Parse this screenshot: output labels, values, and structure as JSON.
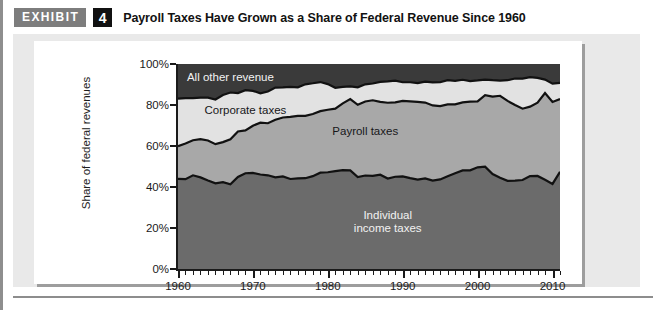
{
  "header": {
    "badge_label": "EXHIBIT",
    "exhibit_number": "4",
    "title": "Payroll Taxes Have Grown as a Share of Federal Revenue Since 1960"
  },
  "colors": {
    "individual_income_taxes": "#6b6b6b",
    "payroll_taxes": "#a8a8a8",
    "corporate_taxes": "#e2e2e2",
    "all_other_revenue": "#3a3a3a",
    "outline": "#111111",
    "panel_background": "#e9e9e9",
    "card_background": "#ffffff",
    "badge_background": "#7d7d7d",
    "number_background": "#111111"
  },
  "chart_data": {
    "type": "area",
    "stacked": true,
    "title": "Payroll Taxes Have Grown as a Share of Federal Revenue Since 1960",
    "xlabel": "",
    "ylabel": "Share of federal revenues",
    "xlim": [
      1960,
      2011
    ],
    "ylim": [
      0,
      100
    ],
    "grid": false,
    "legend_position": "inline-labels",
    "y_ticks": [
      "0%",
      "20%",
      "40%",
      "60%",
      "80%",
      "100%"
    ],
    "y_tick_values": [
      0,
      20,
      40,
      60,
      80,
      100
    ],
    "x_ticks": [
      "1960",
      "1970",
      "1980",
      "1990",
      "2000",
      "2010"
    ],
    "x_tick_values": [
      1960,
      1970,
      1980,
      1990,
      2000,
      2010
    ],
    "x_minor_tick_interval": 1,
    "x": [
      1960,
      1961,
      1962,
      1963,
      1964,
      1965,
      1966,
      1967,
      1968,
      1969,
      1970,
      1971,
      1972,
      1973,
      1974,
      1975,
      1976,
      1977,
      1978,
      1979,
      1980,
      1981,
      1982,
      1983,
      1984,
      1985,
      1986,
      1987,
      1988,
      1989,
      1990,
      1991,
      1992,
      1993,
      1994,
      1995,
      1996,
      1997,
      1998,
      1999,
      2000,
      2001,
      2002,
      2003,
      2004,
      2005,
      2006,
      2007,
      2008,
      2009,
      2010,
      2011
    ],
    "series": [
      {
        "name": "Individual income taxes",
        "label": "Individual income taxes",
        "label_color": "#f2f2f2",
        "color": "#6b6b6b",
        "values": [
          44.0,
          43.8,
          45.7,
          44.7,
          43.2,
          41.8,
          42.4,
          41.3,
          44.9,
          46.7,
          46.9,
          46.1,
          45.7,
          44.7,
          45.2,
          43.9,
          44.2,
          44.3,
          45.3,
          47.0,
          47.2,
          47.7,
          48.2,
          48.1,
          44.8,
          45.6,
          45.4,
          46.0,
          44.1,
          45.0,
          45.2,
          44.3,
          43.6,
          44.2,
          43.1,
          43.7,
          45.2,
          46.7,
          48.1,
          48.1,
          49.6,
          49.9,
          46.3,
          44.5,
          43.0,
          43.1,
          43.4,
          45.3,
          45.4,
          43.5,
          41.5,
          47.4
        ]
      },
      {
        "name": "Payroll taxes",
        "label": "Payroll taxes",
        "label_color": "#17171a",
        "color": "#a8a8a8",
        "values": [
          15.9,
          17.4,
          17.1,
          18.6,
          19.5,
          19.1,
          19.5,
          22.0,
          22.2,
          20.9,
          23.0,
          25.3,
          25.4,
          28.1,
          28.7,
          30.3,
          30.5,
          30.4,
          30.3,
          30.0,
          30.5,
          30.5,
          32.6,
          34.8,
          35.3,
          36.1,
          36.9,
          35.5,
          37.0,
          36.3,
          36.8,
          37.5,
          37.9,
          37.0,
          36.7,
          35.8,
          35.1,
          33.6,
          33.2,
          33.5,
          32.2,
          34.9,
          37.8,
          40.0,
          39.0,
          36.9,
          34.8,
          33.9,
          35.7,
          42.3,
          40.0,
          35.5
        ]
      },
      {
        "name": "Corporate taxes",
        "label": "Corporate taxes",
        "label_color": "#17171a",
        "color": "#e2e2e2",
        "values": [
          23.2,
          22.2,
          20.6,
          20.3,
          20.9,
          21.8,
          23.0,
          22.8,
          18.7,
          19.6,
          17.0,
          14.3,
          15.5,
          15.7,
          14.7,
          14.6,
          13.9,
          15.4,
          15.0,
          14.2,
          12.5,
          10.2,
          8.0,
          6.2,
          8.5,
          8.4,
          8.2,
          9.8,
          10.4,
          10.6,
          9.1,
          9.3,
          9.2,
          10.2,
          11.2,
          11.6,
          11.8,
          11.5,
          11.0,
          10.1,
          10.2,
          7.6,
          8.0,
          7.4,
          10.1,
          12.9,
          14.7,
          14.4,
          12.1,
          6.6,
          8.9,
          7.9
        ]
      },
      {
        "name": "All other revenue",
        "label": "All other revenue",
        "label_color": "#f2f2f2",
        "color": "#3a3a3a",
        "values": [
          16.9,
          16.6,
          16.6,
          16.4,
          16.4,
          17.3,
          15.1,
          13.9,
          14.2,
          12.8,
          13.1,
          14.3,
          13.4,
          11.5,
          11.4,
          11.2,
          11.4,
          9.9,
          9.4,
          8.8,
          9.8,
          11.6,
          11.2,
          10.9,
          11.4,
          9.9,
          9.5,
          8.7,
          8.5,
          8.1,
          8.9,
          8.9,
          9.3,
          8.6,
          9.0,
          8.9,
          7.9,
          8.2,
          7.7,
          8.3,
          8.0,
          7.6,
          7.9,
          8.1,
          7.9,
          7.1,
          7.1,
          6.4,
          6.8,
          7.6,
          9.6,
          9.2
        ]
      }
    ]
  }
}
